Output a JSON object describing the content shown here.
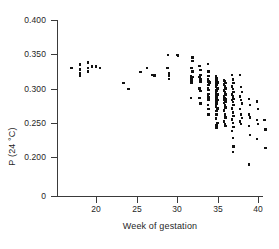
{
  "chart_data": {
    "type": "scatter",
    "title": "",
    "xlabel": "Week of gestation",
    "ylabel": "P (24 °C)",
    "xlim": [
      16,
      42
    ],
    "ylim": [
      0.175,
      0.4
    ],
    "grid": false,
    "legend": null,
    "x_ticks": [
      20,
      25,
      30,
      35,
      40
    ],
    "x_tick_labels": [
      "20",
      "25",
      "30",
      "35",
      "40"
    ],
    "y_ticks": [
      0.2,
      0.25,
      0.3,
      0.35,
      0.4
    ],
    "y_tick_labels": [
      "0.200",
      "0.250",
      "0.300",
      "0.350",
      "0.400"
    ],
    "y_axis_origin_label": "0",
    "y_axis_broken": true,
    "marker_color": "#111111",
    "axis_color": "#3a3a3a",
    "points": [
      [
        17.0,
        0.33
      ],
      [
        18.0,
        0.335
      ],
      [
        18.0,
        0.328
      ],
      [
        18.0,
        0.322
      ],
      [
        18.0,
        0.318
      ],
      [
        19.0,
        0.338
      ],
      [
        19.0,
        0.33
      ],
      [
        19.0,
        0.325
      ],
      [
        19.5,
        0.332
      ],
      [
        20.0,
        0.332
      ],
      [
        20.5,
        0.33
      ],
      [
        23.4,
        0.308
      ],
      [
        24.0,
        0.299
      ],
      [
        25.5,
        0.324
      ],
      [
        26.3,
        0.33
      ],
      [
        27.0,
        0.32
      ],
      [
        27.2,
        0.319
      ],
      [
        28.8,
        0.33
      ],
      [
        28.9,
        0.349
      ],
      [
        29.0,
        0.322
      ],
      [
        29.0,
        0.318
      ],
      [
        29.0,
        0.314
      ],
      [
        30.0,
        0.349
      ],
      [
        30.1,
        0.348
      ],
      [
        31.9,
        0.345
      ],
      [
        31.9,
        0.34
      ],
      [
        31.8,
        0.33
      ],
      [
        31.9,
        0.325
      ],
      [
        31.7,
        0.318
      ],
      [
        31.9,
        0.317
      ],
      [
        31.8,
        0.316
      ],
      [
        31.8,
        0.312
      ],
      [
        31.8,
        0.308
      ],
      [
        31.7,
        0.286
      ],
      [
        32.8,
        0.333
      ],
      [
        32.9,
        0.327
      ],
      [
        32.9,
        0.32
      ],
      [
        32.8,
        0.317
      ],
      [
        32.9,
        0.314
      ],
      [
        32.9,
        0.31
      ],
      [
        32.8,
        0.3
      ],
      [
        32.9,
        0.296
      ],
      [
        32.8,
        0.286
      ],
      [
        32.9,
        0.278
      ],
      [
        33.8,
        0.336
      ],
      [
        33.9,
        0.325
      ],
      [
        33.9,
        0.318
      ],
      [
        33.8,
        0.313
      ],
      [
        33.9,
        0.31
      ],
      [
        34.0,
        0.309
      ],
      [
        33.9,
        0.305
      ],
      [
        33.8,
        0.301
      ],
      [
        33.9,
        0.298
      ],
      [
        33.9,
        0.292
      ],
      [
        33.8,
        0.289
      ],
      [
        33.9,
        0.287
      ],
      [
        33.9,
        0.283
      ],
      [
        33.8,
        0.276
      ],
      [
        33.9,
        0.27
      ],
      [
        33.9,
        0.262
      ],
      [
        34.8,
        0.318
      ],
      [
        34.9,
        0.315
      ],
      [
        34.9,
        0.312
      ],
      [
        34.8,
        0.31
      ],
      [
        35.0,
        0.309
      ],
      [
        34.9,
        0.307
      ],
      [
        34.9,
        0.305
      ],
      [
        34.8,
        0.302
      ],
      [
        35.0,
        0.3
      ],
      [
        34.9,
        0.298
      ],
      [
        34.9,
        0.296
      ],
      [
        34.8,
        0.293
      ],
      [
        35.0,
        0.291
      ],
      [
        34.9,
        0.289
      ],
      [
        34.9,
        0.287
      ],
      [
        34.8,
        0.285
      ],
      [
        35.0,
        0.283
      ],
      [
        34.9,
        0.281
      ],
      [
        34.9,
        0.278
      ],
      [
        34.8,
        0.274
      ],
      [
        35.0,
        0.271
      ],
      [
        34.9,
        0.267
      ],
      [
        34.9,
        0.262
      ],
      [
        34.8,
        0.256
      ],
      [
        35.0,
        0.25
      ],
      [
        34.9,
        0.246
      ],
      [
        34.9,
        0.242
      ],
      [
        35.8,
        0.312
      ],
      [
        35.9,
        0.31
      ],
      [
        36.0,
        0.308
      ],
      [
        35.8,
        0.306
      ],
      [
        35.9,
        0.303
      ],
      [
        36.0,
        0.3
      ],
      [
        35.8,
        0.297
      ],
      [
        35.9,
        0.294
      ],
      [
        36.0,
        0.291
      ],
      [
        35.8,
        0.288
      ],
      [
        35.9,
        0.286
      ],
      [
        36.0,
        0.285
      ],
      [
        35.8,
        0.284
      ],
      [
        35.9,
        0.283
      ],
      [
        36.0,
        0.281
      ],
      [
        35.8,
        0.279
      ],
      [
        35.9,
        0.276
      ],
      [
        36.0,
        0.272
      ],
      [
        35.8,
        0.268
      ],
      [
        35.9,
        0.262
      ],
      [
        36.0,
        0.258
      ],
      [
        35.8,
        0.252
      ],
      [
        35.9,
        0.248
      ],
      [
        36.0,
        0.245
      ],
      [
        36.8,
        0.32
      ],
      [
        36.9,
        0.313
      ],
      [
        37.0,
        0.308
      ],
      [
        36.8,
        0.303
      ],
      [
        36.9,
        0.299
      ],
      [
        37.0,
        0.295
      ],
      [
        36.8,
        0.291
      ],
      [
        36.9,
        0.288
      ],
      [
        37.0,
        0.285
      ],
      [
        36.8,
        0.283
      ],
      [
        36.9,
        0.28
      ],
      [
        37.0,
        0.276
      ],
      [
        36.8,
        0.271
      ],
      [
        36.9,
        0.265
      ],
      [
        37.0,
        0.26
      ],
      [
        36.8,
        0.255
      ],
      [
        36.9,
        0.25
      ],
      [
        37.0,
        0.244
      ],
      [
        36.8,
        0.238
      ],
      [
        36.9,
        0.228
      ],
      [
        37.0,
        0.215
      ],
      [
        36.9,
        0.207
      ],
      [
        37.8,
        0.32
      ],
      [
        37.9,
        0.302
      ],
      [
        38.0,
        0.295
      ],
      [
        37.8,
        0.288
      ],
      [
        37.9,
        0.283
      ],
      [
        38.0,
        0.278
      ],
      [
        37.8,
        0.27
      ],
      [
        37.9,
        0.262
      ],
      [
        38.0,
        0.257
      ],
      [
        37.8,
        0.252
      ],
      [
        37.9,
        0.248
      ],
      [
        38.9,
        0.285
      ],
      [
        39.0,
        0.276
      ],
      [
        38.9,
        0.262
      ],
      [
        39.0,
        0.258
      ],
      [
        38.9,
        0.245
      ],
      [
        39.0,
        0.232
      ],
      [
        38.9,
        0.189
      ],
      [
        39.9,
        0.281
      ],
      [
        40.0,
        0.27
      ],
      [
        39.9,
        0.254
      ],
      [
        40.0,
        0.248
      ],
      [
        39.9,
        0.226
      ],
      [
        40.8,
        0.254
      ],
      [
        40.9,
        0.24
      ],
      [
        40.9,
        0.213
      ]
    ]
  }
}
